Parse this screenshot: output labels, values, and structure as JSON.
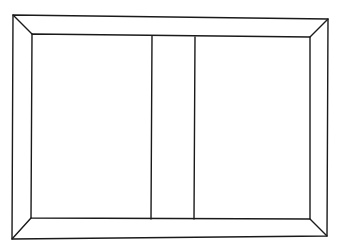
{
  "drawing": {
    "style": "hand-drawn line sketch",
    "stroke_color": "#1a1a1a",
    "background": "#ffffff",
    "outer_frame": {
      "tl": [
        13,
        15
      ],
      "tr": [
        328,
        19
      ],
      "br": [
        327,
        236
      ],
      "bl": [
        12,
        239
      ]
    },
    "inner_frame": {
      "tl": [
        32,
        34
      ],
      "tr": [
        310,
        37
      ],
      "br": [
        310,
        219
      ],
      "bl": [
        31,
        218
      ]
    },
    "dividers": [
      {
        "x_top": 152,
        "y_top": 36,
        "x_bottom": 151,
        "y_bottom": 219
      },
      {
        "x_top": 195,
        "y_top": 37,
        "x_bottom": 194,
        "y_bottom": 219
      }
    ]
  }
}
